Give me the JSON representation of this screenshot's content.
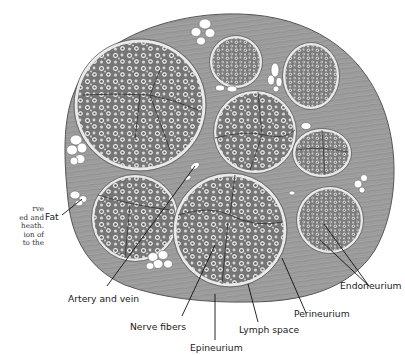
{
  "figure": {
    "labels": {
      "fat": "Fat",
      "artery_and_vein": "Artery and vein",
      "nerve_fibers": "Nerve fibers",
      "epineurium": "Epineurium",
      "lymph_space": "Lymph space",
      "perineurium": "Perineurium",
      "endoneurium": "Endoneurium"
    },
    "caption_fragment": [
      "rve",
      "ed and",
      "heath.",
      "ion of",
      "to the"
    ]
  },
  "colors": {
    "background": "#ffffff",
    "epineurium_fill": "#9a9a9a",
    "fascicle_fill": "#8c8c8c",
    "fiber_ring": "#f2f2f2",
    "fat": "#ffffff",
    "line": "#111111"
  }
}
